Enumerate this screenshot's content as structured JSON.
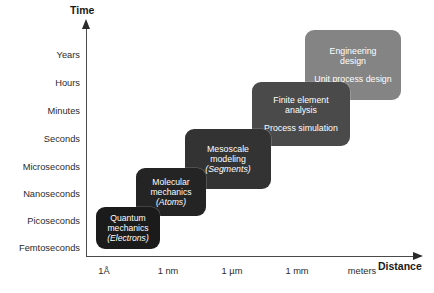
{
  "axes": {
    "y_title": "Time",
    "x_title": "Distance",
    "y_ticks": [
      {
        "label": "Years",
        "top": 50
      },
      {
        "label": "Hours",
        "top": 78
      },
      {
        "label": "Minutes",
        "top": 106
      },
      {
        "label": "Seconds",
        "top": 134
      },
      {
        "label": "Microseconds",
        "top": 162
      },
      {
        "label": "Nanoseconds",
        "top": 189
      },
      {
        "label": "Picoseconds",
        "top": 216
      },
      {
        "label": "Femtoseconds",
        "top": 243
      }
    ],
    "x_ticks": [
      {
        "label": "1Å",
        "left": 104
      },
      {
        "label": "1 nm",
        "left": 168
      },
      {
        "label": "1 µm",
        "left": 232
      },
      {
        "label": "1 mm",
        "left": 297
      },
      {
        "label": "meters",
        "left": 362
      }
    ]
  },
  "steps": [
    {
      "name": "quantum-mechanics",
      "lines": [
        {
          "text": "Quantum",
          "italic": false
        },
        {
          "text": "mechanics",
          "italic": false
        },
        {
          "text": "(Electrons)",
          "italic": true
        }
      ],
      "color": "#1b1b1b",
      "font_size": 8.6,
      "left": 96,
      "top": 207,
      "width": 64,
      "height": 42,
      "z": 60
    },
    {
      "name": "molecular-mechanics",
      "lines": [
        {
          "text": "Molecular",
          "italic": false
        },
        {
          "text": "mechanics",
          "italic": false
        },
        {
          "text": "(Atoms)",
          "italic": true
        }
      ],
      "color": "#242424",
      "font_size": 8.6,
      "left": 136,
      "top": 168,
      "width": 70,
      "height": 48,
      "z": 50
    },
    {
      "name": "mesoscale-modeling",
      "lines": [
        {
          "text": "Mesoscale",
          "italic": false
        },
        {
          "text": "modeling",
          "italic": false
        },
        {
          "text": "(Segments)",
          "italic": true
        }
      ],
      "color": "#333333",
      "font_size": 8.8,
      "left": 185,
      "top": 129,
      "width": 86,
      "height": 60,
      "z": 40
    },
    {
      "name": "finite-element-analysis",
      "lines": [
        {
          "text": "Finite element",
          "italic": false
        },
        {
          "text": "analysis",
          "italic": false
        },
        {
          "gap": true
        },
        {
          "text": "Process simulation",
          "italic": false
        }
      ],
      "color": "#4a4a4a",
      "font_size": 8.8,
      "left": 252,
      "top": 82,
      "width": 98,
      "height": 64,
      "z": 30
    },
    {
      "name": "engineering-design",
      "lines": [
        {
          "text": "Engineering",
          "italic": false
        },
        {
          "text": "design",
          "italic": false
        },
        {
          "gap": true
        },
        {
          "text": "Unit process design",
          "italic": false
        }
      ],
      "color": "#848484",
      "font_size": 8.8,
      "left": 305,
      "top": 30,
      "width": 96,
      "height": 70,
      "z": 20
    }
  ]
}
